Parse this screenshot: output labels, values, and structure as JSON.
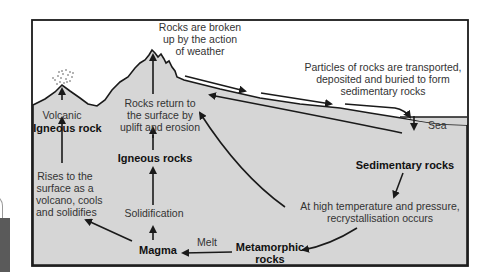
{
  "diagram": {
    "colors": {
      "ground": "#d4d4d4",
      "sky": "#ffffff",
      "sea": "#d4d4d4",
      "line": "#1a1a1a",
      "text": "#333333"
    },
    "labels": {
      "weathering": [
        "Rocks are broken",
        "up by the action",
        "of weather"
      ],
      "transport": [
        "Particles of rocks are transported,",
        "deposited and buried to form",
        "sedimentary rocks"
      ],
      "sea": "Sea",
      "volcanic": "Volcanic",
      "igneous_rock": "Igneous rock",
      "uplift": [
        "Rocks return to",
        "the surface by",
        "uplift and erosion"
      ],
      "igneous_rocks": "Igneous rocks",
      "sedimentary_rocks": "Sedimentary rocks",
      "rises": [
        "Rises to the",
        "surface as a",
        "volcano, cools",
        "and solidifies"
      ],
      "solidification": "Solidification",
      "recrystallisation": [
        "At high temperature and pressure,",
        "recrystallisation occurs"
      ],
      "magma": "Magma",
      "melt": "Melt",
      "metamorphic": [
        "Metamorphic",
        "rocks"
      ]
    }
  }
}
